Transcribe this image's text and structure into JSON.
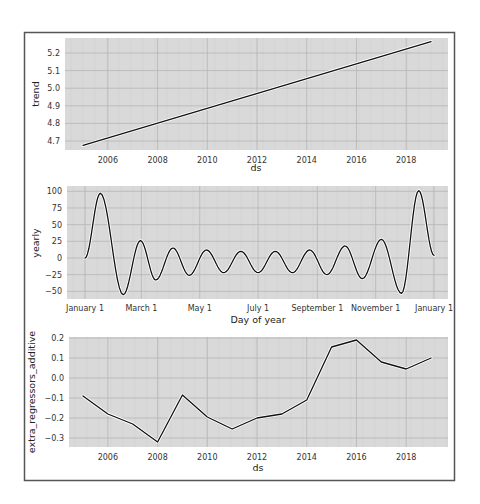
{
  "figure": {
    "background": "#ffffff",
    "plot_background": "#d9d9d9",
    "grid_color": "#b5b5b5",
    "line_color": "#111111"
  },
  "chart_data": [
    {
      "type": "line",
      "title": "",
      "xlabel": "ds",
      "ylabel": "trend",
      "x_tick_labels": [
        "2006",
        "2008",
        "2010",
        "2012",
        "2014",
        "2016",
        "2018"
      ],
      "y_tick_labels": [
        "4.7",
        "4.8",
        "4.9",
        "5.0",
        "5.1",
        "5.2"
      ],
      "xlim": [
        2004.5,
        2019.7
      ],
      "ylim": [
        4.65,
        5.28
      ],
      "grid": true,
      "x": [
        2005,
        2019
      ],
      "values": [
        4.675,
        5.265
      ]
    },
    {
      "type": "line",
      "title": "",
      "xlabel": "Day of year",
      "ylabel": "yearly",
      "x_tick_labels": [
        "January 1",
        "March 1",
        "May 1",
        "July 1",
        "September 1",
        "November 1",
        "January 1"
      ],
      "x_tick_days": [
        0,
        59,
        120,
        181,
        243,
        304,
        365
      ],
      "y_tick_labels": [
        "−50",
        "−25",
        "0",
        "25",
        "50",
        "75",
        "100"
      ],
      "xlim": [
        -18,
        380
      ],
      "ylim": [
        -62,
        104
      ],
      "grid": true,
      "x": [
        0,
        16,
        40,
        58,
        74,
        92,
        109,
        127,
        145,
        163,
        181,
        199,
        217,
        235,
        253,
        272,
        290,
        310,
        331,
        349
      ],
      "values": [
        0,
        97,
        -55,
        26,
        -33,
        15,
        -26,
        12,
        -22,
        10,
        -22,
        10,
        -22,
        12,
        -25,
        18,
        -31,
        28,
        -53,
        101
      ]
    },
    {
      "type": "line",
      "title": "",
      "xlabel": "ds",
      "ylabel": "extra_regressors_additive",
      "x_tick_labels": [
        "2006",
        "2008",
        "2010",
        "2012",
        "2014",
        "2016",
        "2018"
      ],
      "y_tick_labels": [
        "−0.3",
        "−0.2",
        "−0.1",
        "0.0",
        "0.1",
        "0.2"
      ],
      "xlim": [
        2004.5,
        2019.7
      ],
      "ylim": [
        -0.35,
        0.205
      ],
      "grid": true,
      "x": [
        2005,
        2006,
        2007,
        2008,
        2009,
        2010,
        2011,
        2012,
        2013,
        2014,
        2015,
        2016,
        2017,
        2018,
        2019
      ],
      "values": [
        -0.09,
        -0.18,
        -0.23,
        -0.32,
        -0.085,
        -0.195,
        -0.255,
        -0.2,
        -0.18,
        -0.11,
        0.155,
        0.19,
        0.08,
        0.045,
        0.1
      ]
    }
  ],
  "yearly_end": {
    "x": 365,
    "value": 4
  }
}
